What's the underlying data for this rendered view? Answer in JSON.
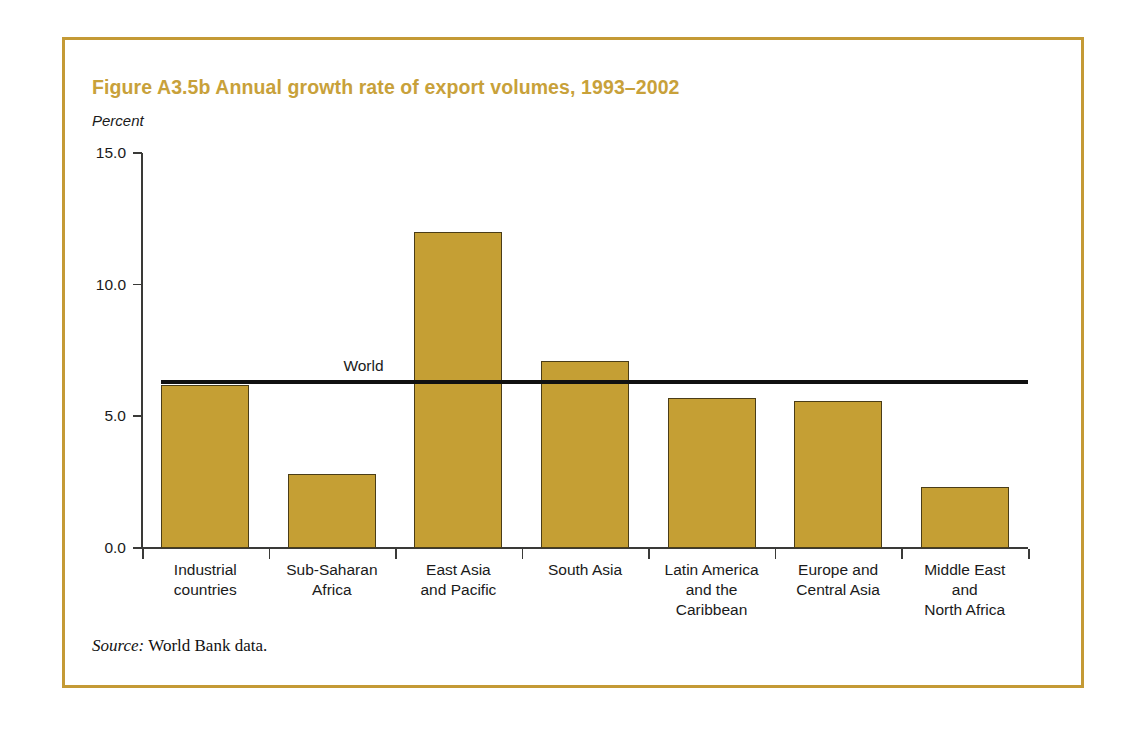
{
  "figure": {
    "title": "Figure A3.5b  Annual growth rate of export volumes, 1993–2002",
    "unit_label": "Percent",
    "source_word": "Source:",
    "source_text": " World Bank data.",
    "frame_color": "#c49a35",
    "title_color": "#c8a13a",
    "bar_color": "#c59f34",
    "bar_border_color": "#4a3d18",
    "reference_line_color": "#111111"
  },
  "chart_data": {
    "type": "bar",
    "title": "Figure A3.5b  Annual growth rate of export volumes, 1993–2002",
    "xlabel": "",
    "ylabel": "Percent",
    "ylim": [
      0.0,
      15.0
    ],
    "yticks": [
      0.0,
      5.0,
      10.0,
      15.0
    ],
    "ytick_labels": [
      "0.0",
      "5.0",
      "10.0",
      "15.0"
    ],
    "grid": false,
    "legend": "none",
    "categories": [
      "Industrial\ncountries",
      "Sub-Saharan\nAfrica",
      "East Asia\nand Pacific",
      "South Asia",
      "Latin America\nand the\nCaribbean",
      "Europe and\nCentral Asia",
      "Middle East\nand\nNorth Africa"
    ],
    "category_lines": [
      [
        "Industrial",
        "countries"
      ],
      [
        "Sub-Saharan",
        "Africa"
      ],
      [
        "East Asia",
        "and Pacific"
      ],
      [
        "South Asia"
      ],
      [
        "Latin America",
        "and the",
        "Caribbean"
      ],
      [
        "Europe and",
        "Central Asia"
      ],
      [
        "Middle East",
        "and",
        "North Africa"
      ]
    ],
    "values": [
      6.2,
      2.8,
      12.0,
      7.1,
      5.7,
      5.6,
      2.3
    ],
    "annotations": [
      {
        "label": "World",
        "type": "reference-line",
        "value": 6.3
      }
    ]
  }
}
